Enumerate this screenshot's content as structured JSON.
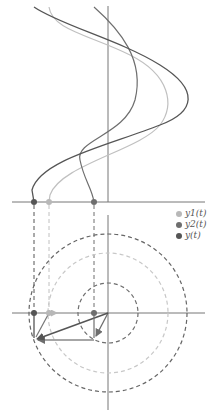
{
  "colors": {
    "y1": "#b8b8b8",
    "y2": "#6e6e6e",
    "y": "#555555",
    "axis": "#777777"
  },
  "legend": {
    "items": [
      {
        "label": "y1(t)",
        "color": "#b8b8b8"
      },
      {
        "label": "y2(t)",
        "color": "#6e6e6e"
      },
      {
        "label": "y(t)",
        "color": "#555555"
      }
    ]
  },
  "diagram": {
    "title": "",
    "top_panel": "time-domain curves y1(t), y2(t), y(t) plotted vertically",
    "bottom_panel": "phasor diagram with rotating vectors and dashed circles",
    "circles": [
      {
        "name": "y",
        "radius": 79
      },
      {
        "name": "y1",
        "radius": 60
      },
      {
        "name": "y2",
        "radius": 30
      }
    ]
  }
}
